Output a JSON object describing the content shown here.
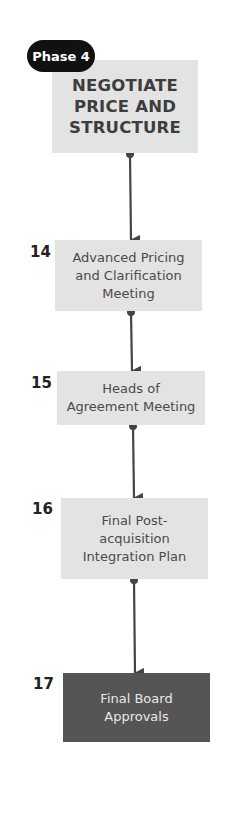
{
  "phase": {
    "label": "Phase 4",
    "title_lines": [
      "NEGOTIATE",
      "PRICE AND",
      "STRUCTURE"
    ]
  },
  "steps": [
    {
      "number": "14",
      "lines": [
        "Advanced Pricing",
        "and Clarification",
        "Meeting"
      ],
      "style": "light"
    },
    {
      "number": "15",
      "lines": [
        "Heads of",
        "Agreement Meeting"
      ],
      "style": "light"
    },
    {
      "number": "16",
      "lines": [
        "Final Post-",
        "acquisition",
        "Integration Plan"
      ],
      "style": "light"
    },
    {
      "number": "17",
      "lines": [
        "Final Board",
        "Approvals"
      ],
      "style": "dark"
    }
  ],
  "colors": {
    "box_light": "#e3e3e3",
    "box_dark": "#555555",
    "pill": "#111111",
    "connector": "#444444"
  }
}
